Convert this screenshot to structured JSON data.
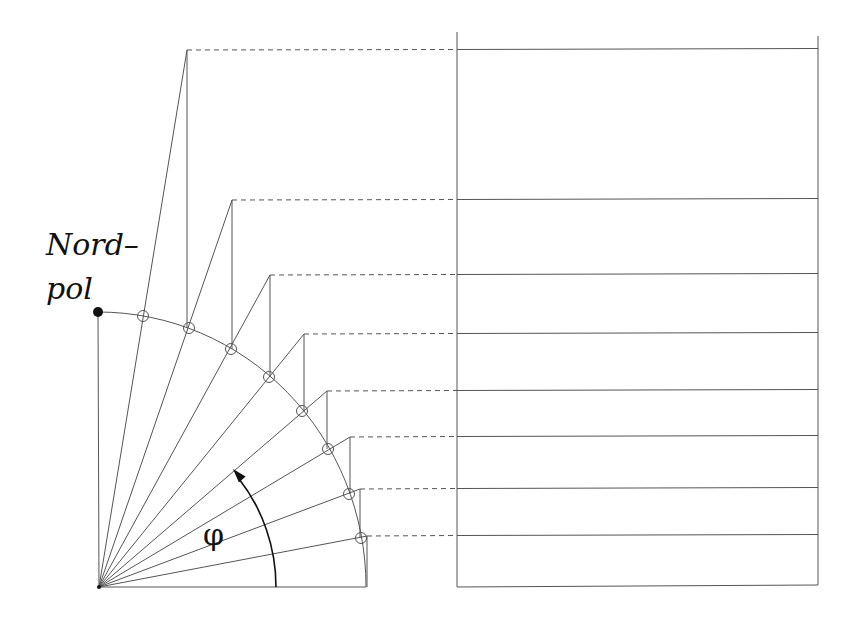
{
  "labels": {
    "nordpol_line1": "Nord–",
    "nordpol_line2": "pol",
    "angle_symbol": "φ"
  },
  "colors": {
    "line": "#555555",
    "ink": "#111111",
    "background": "#ffffff"
  },
  "geometry": {
    "origin": [
      99,
      587
    ],
    "arc_radius_x": 268,
    "arc_radius_y": 275,
    "north_pole": [
      98,
      312
    ],
    "arc_end": [
      366,
      587
    ],
    "circle_radius": 5.5,
    "circles": [
      [
        143,
        316
      ],
      [
        189,
        328
      ],
      [
        231,
        349
      ],
      [
        269,
        377
      ],
      [
        302,
        411
      ],
      [
        328,
        449
      ],
      [
        349,
        494
      ],
      [
        361,
        538
      ]
    ],
    "spoke_tops": [
      [
        187,
        50
      ],
      [
        232,
        200
      ],
      [
        270,
        275
      ],
      [
        304,
        334
      ],
      [
        327,
        391
      ],
      [
        350,
        437
      ],
      [
        360,
        489
      ],
      [
        367,
        536
      ]
    ],
    "rect": {
      "left": 457,
      "right": 818,
      "left_top": 32,
      "right_top": 36,
      "bottom": 587
    },
    "phi_arc": {
      "radius": 177,
      "start": [
        276,
        587
      ],
      "tip": [
        233,
        469
      ]
    }
  }
}
